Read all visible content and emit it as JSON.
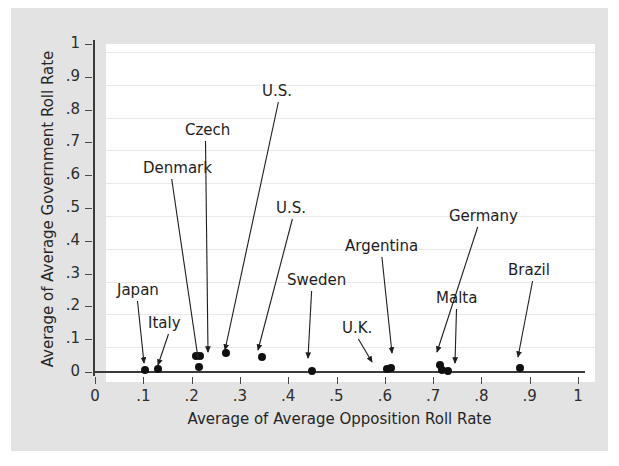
{
  "chart_data": {
    "type": "scatter",
    "title": "",
    "xlabel": "Average of Average Opposition Roll Rate",
    "ylabel": "Average of Average Government Roll Rate",
    "xlim": [
      0,
      1
    ],
    "ylim": [
      0,
      1
    ],
    "xticks": [
      "0",
      ".1",
      ".2",
      ".3",
      ".4",
      ".5",
      ".6",
      ".7",
      ".8",
      ".9",
      "1"
    ],
    "xtick_values": [
      0,
      0.1,
      0.2,
      0.3,
      0.4,
      0.5,
      0.6,
      0.7,
      0.8,
      0.9,
      1
    ],
    "yticks": [
      "0",
      ".1",
      ".2",
      ".3",
      ".4",
      ".5",
      ".6",
      ".7",
      ".8",
      ".9",
      "1"
    ],
    "ytick_values": [
      0,
      0.1,
      0.2,
      0.3,
      0.4,
      0.5,
      0.6,
      0.7,
      0.8,
      0.9,
      1
    ],
    "grid": "horizontal",
    "legend": "none",
    "marker_color": "#101010",
    "points": [
      {
        "x": 0.103,
        "y": 0.005,
        "label": "Japan"
      },
      {
        "x": 0.13,
        "y": 0.008,
        "label": "Italy"
      },
      {
        "x": 0.21,
        "y": 0.05,
        "label": "Denmark"
      },
      {
        "x": 0.218,
        "y": 0.048,
        "label": "Czech"
      },
      {
        "x": 0.215,
        "y": 0.015,
        "label": ""
      },
      {
        "x": 0.272,
        "y": 0.057,
        "label": "U.S."
      },
      {
        "x": 0.345,
        "y": 0.045,
        "label": "U.S."
      },
      {
        "x": 0.45,
        "y": 0.003,
        "label": "Sweden"
      },
      {
        "x": 0.605,
        "y": 0.008,
        "label": "U.K."
      },
      {
        "x": 0.612,
        "y": 0.012,
        "label": "Argentina"
      },
      {
        "x": 0.715,
        "y": 0.02,
        "label": "Germany"
      },
      {
        "x": 0.718,
        "y": 0.006,
        "label": ""
      },
      {
        "x": 0.73,
        "y": 0.002,
        "label": "Malta"
      },
      {
        "x": 0.88,
        "y": 0.013,
        "label": "Brazil"
      }
    ],
    "annotations": [
      {
        "text": "Japan",
        "label_x": 117,
        "label_y": 282,
        "tip_x": 144,
        "tip_y": 363
      },
      {
        "text": "Italy",
        "label_x": 148,
        "label_y": 315,
        "tip_x": 158,
        "tip_y": 365
      },
      {
        "text": "Denmark",
        "label_x": 143,
        "label_y": 160,
        "tip_x": 198,
        "tip_y": 358
      },
      {
        "text": "Czech",
        "label_x": 185,
        "label_y": 122,
        "tip_x": 208,
        "tip_y": 352
      },
      {
        "text": "U.S.",
        "label_x": 262,
        "label_y": 83,
        "tip_x": 225,
        "tip_y": 350
      },
      {
        "text": "U.S.",
        "label_x": 276,
        "label_y": 200,
        "tip_x": 258,
        "tip_y": 350
      },
      {
        "text": "Sweden",
        "label_x": 287,
        "label_y": 272,
        "tip_x": 308,
        "tip_y": 358
      },
      {
        "text": "U.K.",
        "label_x": 342,
        "label_y": 320,
        "tip_x": 372,
        "tip_y": 362
      },
      {
        "text": "Argentina",
        "label_x": 345,
        "label_y": 238,
        "tip_x": 392,
        "tip_y": 353
      },
      {
        "text": "Germany",
        "label_x": 449,
        "label_y": 208,
        "tip_x": 437,
        "tip_y": 352
      },
      {
        "text": "Malta",
        "label_x": 436,
        "label_y": 290,
        "tip_x": 455,
        "tip_y": 363
      },
      {
        "text": "Brazil",
        "label_x": 508,
        "label_y": 262,
        "tip_x": 518,
        "tip_y": 357
      }
    ]
  }
}
